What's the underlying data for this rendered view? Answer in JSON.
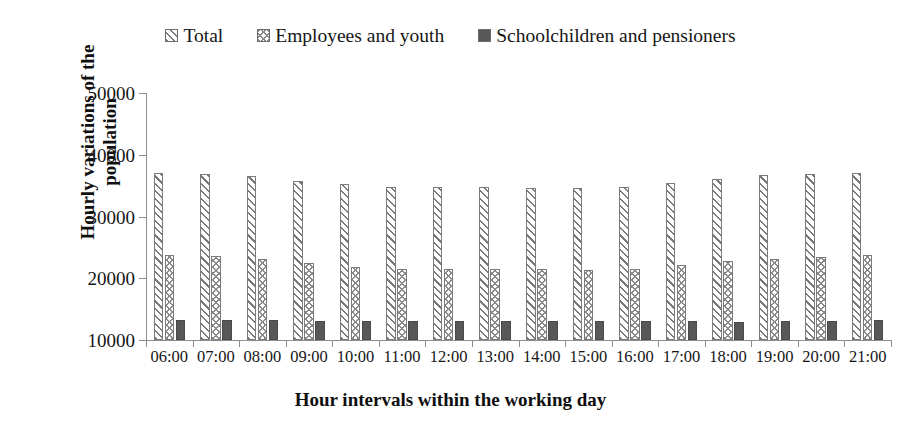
{
  "chart_data": {
    "type": "bar",
    "title": "",
    "xlabel": "Hour intervals within the working day",
    "ylabel": "Hourly variations of the population",
    "ylim": [
      10000,
      50000
    ],
    "ytick_labels": [
      "10000",
      "20000",
      "30000",
      "40000",
      "50000"
    ],
    "ytick_values": [
      10000,
      20000,
      30000,
      40000,
      50000
    ],
    "grid": false,
    "legend_position": "top-center",
    "categories": [
      "06:00",
      "07:00",
      "08:00",
      "09:00",
      "10:00",
      "11:00",
      "12:00",
      "13:00",
      "14:00",
      "15:00",
      "16:00",
      "17:00",
      "18:00",
      "19:00",
      "20:00",
      "21:00"
    ],
    "series": [
      {
        "name": "Total",
        "pattern": "diagonal-hatch-forward",
        "color": "#7a7a7a",
        "values": [
          37100,
          36950,
          36550,
          35800,
          35250,
          34700,
          34750,
          34800,
          34650,
          34600,
          34700,
          35450,
          36150,
          36700,
          36900,
          37100
        ]
      },
      {
        "name": "Employees and youth",
        "pattern": "crosshatch-chevron",
        "color": "#8a8a8a",
        "values": [
          23750,
          23600,
          23150,
          22400,
          21850,
          21500,
          21500,
          21500,
          21450,
          21400,
          21450,
          22200,
          22850,
          23150,
          23450,
          23800
        ]
      },
      {
        "name": "Schoolchildren and pensioners",
        "pattern": "solid",
        "color": "#585858",
        "values": [
          13300,
          13300,
          13200,
          13150,
          13150,
          13150,
          13100,
          13050,
          13000,
          13000,
          13050,
          13100,
          12950,
          13100,
          13150,
          13200
        ]
      }
    ]
  }
}
